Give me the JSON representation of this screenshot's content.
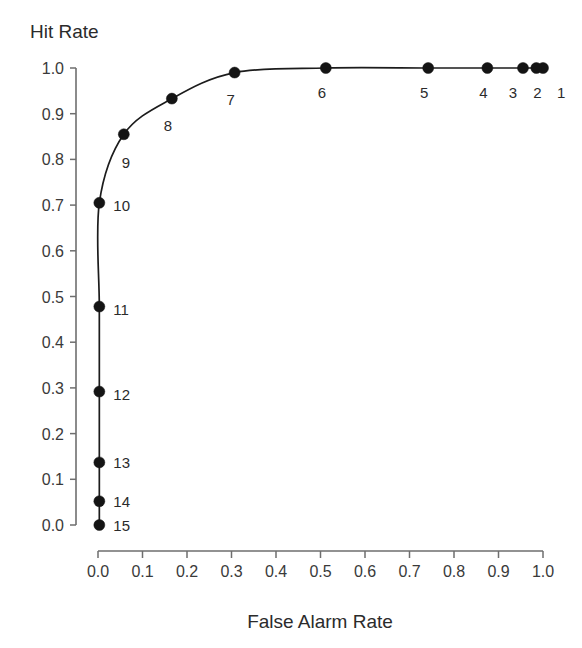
{
  "chart_data": {
    "type": "scatter",
    "title": "",
    "xlabel": "False Alarm Rate",
    "ylabel": "Hit Rate",
    "xlim": [
      0.0,
      1.0
    ],
    "ylim": [
      0.0,
      1.0
    ],
    "grid": false,
    "legend": "none",
    "series_name": "ROC curve",
    "xticks": [
      "0.0",
      "0.1",
      "0.2",
      "0.3",
      "0.4",
      "0.5",
      "0.6",
      "0.7",
      "0.8",
      "0.9",
      "1.0"
    ],
    "yticks": [
      "0.0",
      "0.1",
      "0.2",
      "0.3",
      "0.4",
      "0.5",
      "0.6",
      "0.7",
      "0.8",
      "0.9",
      "1.0"
    ],
    "xtick_values": [
      0.0,
      0.1,
      0.2,
      0.3,
      0.4,
      0.5,
      0.6,
      0.7,
      0.8,
      0.9,
      1.0
    ],
    "ytick_values": [
      0.0,
      0.1,
      0.2,
      0.3,
      0.4,
      0.5,
      0.6,
      0.7,
      0.8,
      0.9,
      1.0
    ],
    "point_labels": [
      "1",
      "2",
      "3",
      "4",
      "5",
      "6",
      "7",
      "8",
      "9",
      "10",
      "11",
      "12",
      "13",
      "14",
      "15"
    ],
    "x": [
      1.0,
      0.985,
      0.955,
      0.875,
      0.742,
      0.512,
      0.307,
      0.166,
      0.058,
      0.003,
      0.003,
      0.003,
      0.003,
      0.003,
      0.003
    ],
    "y": [
      1.0,
      1.0,
      1.0,
      1.0,
      1.0,
      1.0,
      0.99,
      0.933,
      0.855,
      0.705,
      0.478,
      0.292,
      0.137,
      0.052,
      0.0
    ],
    "points": [
      {
        "label": "1",
        "x": 1.0,
        "y": 1.0,
        "label_dx": 14,
        "label_dy": 30
      },
      {
        "label": "2",
        "x": 0.985,
        "y": 1.0,
        "label_dx": 1,
        "label_dy": 30
      },
      {
        "label": "3",
        "x": 0.955,
        "y": 1.0,
        "label_dx": -10,
        "label_dy": 30
      },
      {
        "label": "4",
        "x": 0.875,
        "y": 1.0,
        "label_dx": -4,
        "label_dy": 30
      },
      {
        "label": "5",
        "x": 0.742,
        "y": 1.0,
        "label_dx": -4,
        "label_dy": 30
      },
      {
        "label": "6",
        "x": 0.512,
        "y": 1.0,
        "label_dx": -4,
        "label_dy": 30
      },
      {
        "label": "7",
        "x": 0.307,
        "y": 0.99,
        "label_dx": -4,
        "label_dy": 32
      },
      {
        "label": "8",
        "x": 0.166,
        "y": 0.933,
        "label_dx": -4,
        "label_dy": 32
      },
      {
        "label": "9",
        "x": 0.058,
        "y": 0.855,
        "label_dx": 2,
        "label_dy": 34
      },
      {
        "label": "10",
        "x": 0.003,
        "y": 0.705,
        "label_dx": 14,
        "label_dy": 8
      },
      {
        "label": "11",
        "x": 0.003,
        "y": 0.478,
        "label_dx": 14,
        "label_dy": 8
      },
      {
        "label": "12",
        "x": 0.003,
        "y": 0.292,
        "label_dx": 14,
        "label_dy": 8
      },
      {
        "label": "13",
        "x": 0.003,
        "y": 0.137,
        "label_dx": 14,
        "label_dy": 6
      },
      {
        "label": "14",
        "x": 0.003,
        "y": 0.052,
        "label_dx": 14,
        "label_dy": 6
      },
      {
        "label": "15",
        "x": 0.003,
        "y": 0.0,
        "label_dx": 14,
        "label_dy": 6
      }
    ],
    "marker": "filled-circle",
    "marker_size_px": 11,
    "line_color": "#1c1c1c",
    "marker_color": "#141414",
    "axis_color": "#6e6e6e",
    "text_color": "#2b2b2b",
    "background": "#ffffff"
  }
}
